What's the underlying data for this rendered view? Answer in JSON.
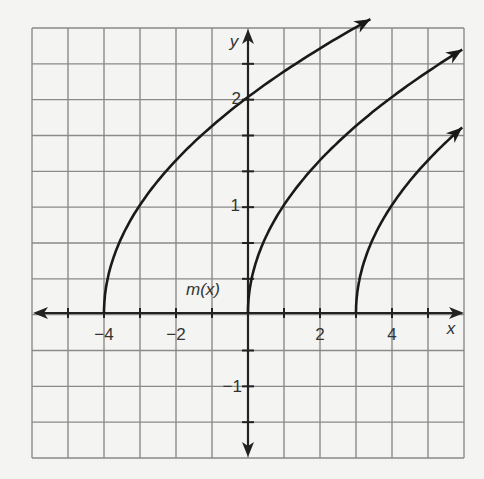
{
  "chart_data": {
    "type": "line",
    "title": "",
    "xlabel": "x",
    "ylabel": "y",
    "function_label": "m(x)",
    "xlim": [
      -6,
      6
    ],
    "ylim": [
      -1.333,
      2.667
    ],
    "grid": true,
    "grid_cell": {
      "x_units": 1,
      "y_units": 0.3333
    },
    "x_ticks": [
      -4,
      -2,
      2,
      4
    ],
    "x_tick_labels": [
      "−4",
      "−2",
      "2",
      "4"
    ],
    "y_ticks": [
      1,
      2,
      -1
    ],
    "y_tick_labels": [
      "1",
      "2",
      "−1"
    ],
    "series": [
      {
        "name": "m(x)",
        "formula": "sqrt(x+4)",
        "start": [
          -4,
          0
        ],
        "x": [
          -4,
          -3,
          0,
          3.4
        ],
        "y": [
          0,
          1,
          2,
          2.65
        ]
      },
      {
        "name": "curve-2",
        "formula": "sqrt(x)",
        "start": [
          0,
          0
        ],
        "x": [
          0,
          1,
          4,
          5.95
        ],
        "y": [
          0,
          1,
          2,
          2.32
        ]
      },
      {
        "name": "curve-3",
        "formula": "sqrt(x-3)",
        "start": [
          3,
          0
        ],
        "x": [
          3,
          4,
          5.95
        ],
        "y": [
          0,
          1,
          1.78
        ]
      }
    ],
    "colors": {
      "grid": "#8a8a8a",
      "axis": "#222222",
      "curve": "#1a1a1a",
      "background": "#f4f4f2"
    }
  }
}
